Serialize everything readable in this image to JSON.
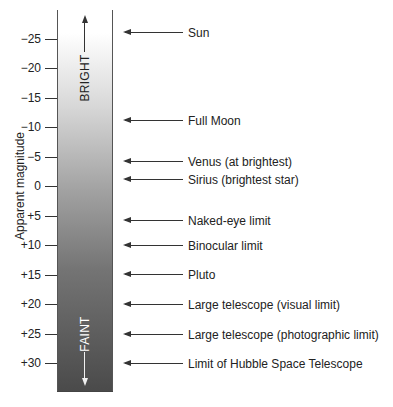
{
  "chart_data": {
    "type": "scale-diagram",
    "title": "",
    "ylabel": "Apparent magnitude",
    "axis": {
      "direction": "inverted",
      "ylim": [
        -28,
        33
      ],
      "ticks": [
        -25,
        -20,
        -15,
        -10,
        -5,
        0,
        5,
        10,
        15,
        20,
        25,
        30
      ],
      "tick_labels": [
        "−25",
        "−20",
        "−15",
        "−10",
        "−5",
        "0",
        "+5",
        "+10",
        "+15",
        "+20",
        "+25",
        "+30"
      ]
    },
    "bar_gradient": {
      "top_color": "#ffffff",
      "bottom_color": "#4a4a4a"
    },
    "direction_labels": {
      "top": "BRIGHT",
      "bottom": "FAINT"
    },
    "annotations": [
      {
        "label": "Sun",
        "magnitude": -26
      },
      {
        "label": "Full Moon",
        "magnitude": -11
      },
      {
        "label": "Venus (at brightest)",
        "magnitude": -4
      },
      {
        "label": "Sirius (brightest star)",
        "magnitude": -1.5
      },
      {
        "label": "Naked-eye limit",
        "magnitude": 6
      },
      {
        "label": "Binocular limit",
        "magnitude": 10
      },
      {
        "label": "Pluto",
        "magnitude": 15
      },
      {
        "label": "Large telescope (visual limit)",
        "magnitude": 20
      },
      {
        "label": "Large telescope (photographic limit)",
        "magnitude": 25
      },
      {
        "label": "Limit of Hubble Space Telescope",
        "magnitude": 30
      }
    ]
  },
  "layout": {
    "zero_y": 186,
    "px_per_mag": 5.9
  }
}
